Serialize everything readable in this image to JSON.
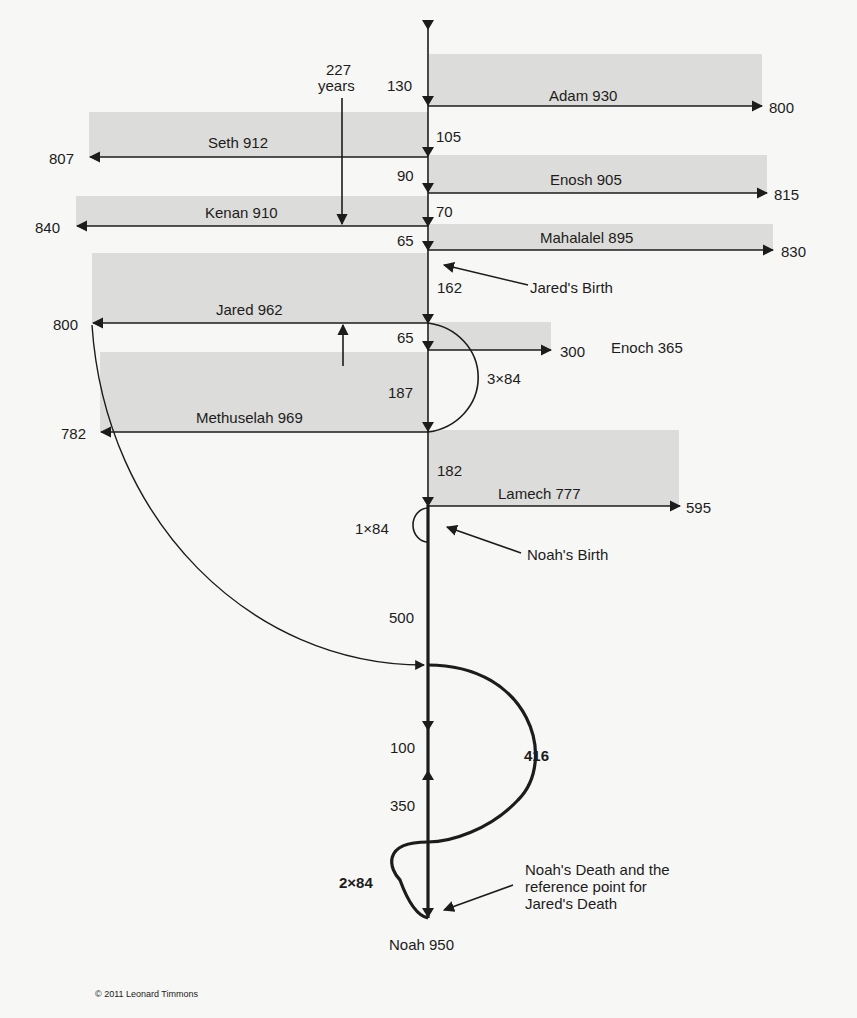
{
  "diagram": {
    "patriarchs": [
      {
        "name_label": "Adam 930",
        "end_label": "800"
      },
      {
        "name_label": "Seth 912",
        "end_label": "807"
      },
      {
        "name_label": "Enosh 905",
        "end_label": "815"
      },
      {
        "name_label": "Kenan 910",
        "end_label": "840"
      },
      {
        "name_label": "Mahalalel 895",
        "end_label": "830"
      },
      {
        "name_label": "Jared 962",
        "end_label": "800"
      },
      {
        "name_label": "Enoch 365",
        "end_label": "300"
      },
      {
        "name_label": "Methuselah 969",
        "end_label": "782"
      },
      {
        "name_label": "Lamech 777",
        "end_label": "595"
      },
      {
        "name_label": "Noah 950"
      }
    ],
    "intervals": [
      "130",
      "105",
      "90",
      "70",
      "65",
      "162",
      "65",
      "187",
      "182",
      "500",
      "100",
      "350"
    ],
    "span_227": {
      "line1": "227",
      "line2": "years"
    },
    "arcs": {
      "enoch": "3×84",
      "noah_birth": "1×84",
      "jared_416": "416",
      "noah_death": "2×84"
    },
    "annotations": {
      "jared_birth": "Jared's Birth",
      "noah_birth": "Noah's Birth",
      "noah_death": [
        "Noah's Death and the",
        "reference point for",
        "Jared's Death"
      ]
    },
    "copyright": "© 2011 Leonard Timmons"
  },
  "colors": {
    "box": "#dcdcda",
    "line": "#1c1c1c",
    "background": "#f7f7f5"
  }
}
